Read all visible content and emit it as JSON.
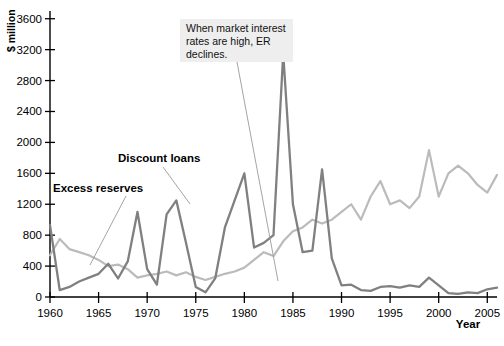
{
  "chart_data": {
    "type": "line",
    "title": "",
    "xlabel": "Year",
    "ylabel": "$ million",
    "xlim": [
      1960,
      2006
    ],
    "ylim": [
      0,
      3700
    ],
    "grid": false,
    "legend_position": "inline-labels",
    "xticks": [
      1960,
      1965,
      1970,
      1975,
      1980,
      1985,
      1990,
      1995,
      2000,
      2005
    ],
    "xticklabels": [
      "1960",
      "1965",
      "1970",
      "1975",
      "1980",
      "1985",
      "1990",
      "1995",
      "2000",
      "2005"
    ],
    "yticks": [
      0,
      400,
      800,
      1200,
      1600,
      2000,
      2400,
      2800,
      3200,
      3600
    ],
    "yticklabels": [
      "0",
      "400",
      "800",
      "1200",
      "1600",
      "2000",
      "2400",
      "2800",
      "3200",
      "3600"
    ],
    "x": [
      1960,
      1961,
      1962,
      1963,
      1964,
      1965,
      1966,
      1967,
      1968,
      1969,
      1970,
      1971,
      1972,
      1973,
      1974,
      1975,
      1976,
      1977,
      1978,
      1979,
      1980,
      1981,
      1982,
      1983,
      1984,
      1985,
      1986,
      1987,
      1988,
      1989,
      1990,
      1991,
      1992,
      1993,
      1994,
      1995,
      1996,
      1997,
      1998,
      1999,
      2000,
      2001,
      2002,
      2003,
      2004,
      2005,
      2006
    ],
    "series": [
      {
        "name": "Discount loans",
        "color": "#808080",
        "values": [
          930,
          90,
          130,
          200,
          250,
          300,
          430,
          240,
          460,
          1100,
          360,
          160,
          1070,
          1250,
          700,
          130,
          60,
          240,
          900,
          1250,
          1600,
          640,
          700,
          800,
          3150,
          1200,
          580,
          600,
          1650,
          500,
          150,
          160,
          90,
          80,
          130,
          140,
          120,
          150,
          130,
          250,
          150,
          50,
          40,
          60,
          50,
          100,
          120
        ]
      },
      {
        "name": "Excess reserves",
        "color": "#bbbbbb",
        "values": [
          540,
          750,
          620,
          580,
          540,
          480,
          400,
          420,
          360,
          250,
          280,
          300,
          330,
          280,
          320,
          260,
          220,
          260,
          300,
          330,
          380,
          480,
          580,
          530,
          720,
          850,
          900,
          1000,
          950,
          1000,
          1100,
          1200,
          1000,
          1300,
          1500,
          1200,
          1250,
          1150,
          1300,
          1900,
          1300,
          1600,
          1700,
          1600,
          1450,
          1350,
          1580
        ]
      }
    ],
    "annotations": [
      {
        "id": "er-declines-note",
        "text_lines": [
          "When market interest",
          "rates are high, ER",
          "declines."
        ],
        "points_to_year": 1981
      },
      {
        "id": "excess-reserves-label",
        "text": "Excess reserves",
        "points_to_year": 1963
      },
      {
        "id": "discount-loans-label",
        "text": "Discount loans",
        "points_to_year": 1973
      }
    ]
  },
  "labels": {
    "y_axis_title": "$ million",
    "x_axis_title": "Year",
    "excess_reserves": "Excess reserves",
    "discount_loans": "Discount loans",
    "annotation_line1": "When market interest",
    "annotation_line2": "rates are high, ER",
    "annotation_line3": "declines."
  },
  "colors": {
    "discount_loans": "#808080",
    "excess_reserves": "#bbbbbb",
    "axis": "#000000",
    "annotation_bg": "#eeeeee"
  }
}
